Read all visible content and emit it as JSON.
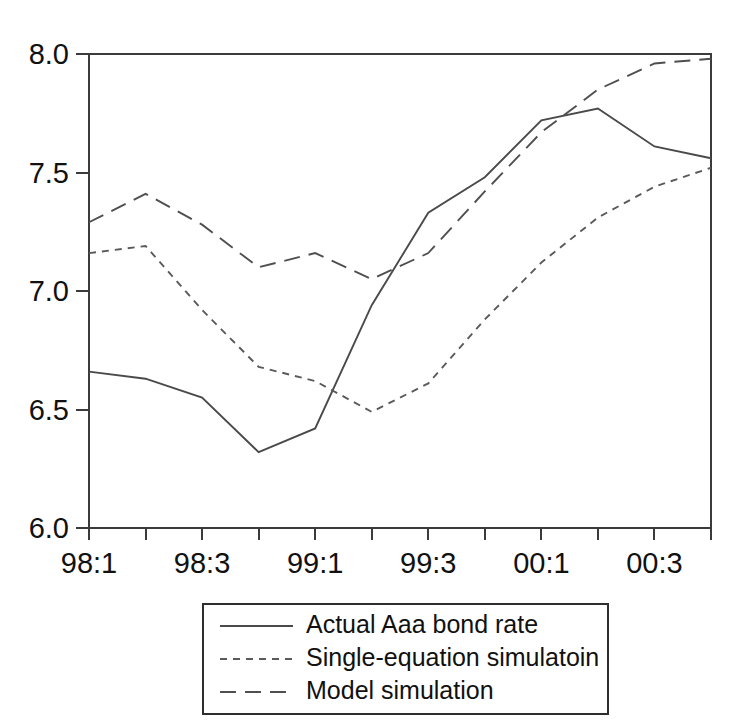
{
  "chart_data": {
    "type": "line",
    "title": "",
    "subtitle": "",
    "xlabel": "",
    "ylabel": "",
    "x": [
      "98:1",
      "98:2",
      "98:3",
      "98:4",
      "99:1",
      "99:2",
      "99:3",
      "99:4",
      "00:1",
      "00:2",
      "00:3",
      "00:4"
    ],
    "x_tick_labels": [
      "98:1",
      "98:3",
      "99:1",
      "99:3",
      "00:1",
      "00:3"
    ],
    "x_tick_indices": [
      0,
      2,
      4,
      6,
      8,
      10
    ],
    "y_tick_labels": [
      "6.0",
      "6.5",
      "7.0",
      "7.5",
      "8.0"
    ],
    "y_tick_values": [
      6.0,
      6.5,
      7.0,
      7.5,
      8.0
    ],
    "ylim": [
      6.0,
      8.0
    ],
    "grid": false,
    "legend_position": "below-center",
    "series": [
      {
        "name": "Actual Aaa bond rate",
        "style": "solid",
        "color": "#4a4a4a",
        "values": [
          6.66,
          6.63,
          6.55,
          6.32,
          6.42,
          6.94,
          7.33,
          7.48,
          7.72,
          7.77,
          7.61,
          7.56
        ]
      },
      {
        "name": "Single-equation simulatoin",
        "style": "short-dash",
        "color": "#5a5a5a",
        "values": [
          7.16,
          7.19,
          6.92,
          6.68,
          6.62,
          6.49,
          6.61,
          6.88,
          7.12,
          7.31,
          7.44,
          7.52
        ]
      },
      {
        "name": "Model simulation",
        "style": "long-dash",
        "color": "#4f4f4f",
        "values": [
          7.29,
          7.41,
          7.28,
          7.1,
          7.16,
          7.05,
          7.16,
          7.42,
          7.67,
          7.85,
          7.96,
          7.98
        ]
      }
    ]
  },
  "legend": {
    "entries": [
      {
        "label": "Actual Aaa bond rate",
        "style": "solid"
      },
      {
        "label": "Single-equation simulatoin",
        "style": "short-dash"
      },
      {
        "label": "Model simulation",
        "style": "long-dash"
      }
    ]
  },
  "layout": {
    "plot_left": 89,
    "plot_right": 711,
    "plot_top": 54,
    "plot_bottom": 528,
    "legend_left": 203,
    "legend_top": 604,
    "legend_width": 405,
    "legend_height": 110
  }
}
